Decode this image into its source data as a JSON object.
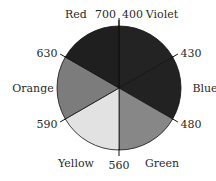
{
  "chart_data": {
    "type": "pie",
    "title": "",
    "slices": [
      {
        "name": "Violet",
        "value": 1,
        "start_wavelength": "400",
        "end_wavelength": "430",
        "color": "#232323"
      },
      {
        "name": "Blue",
        "value": 1,
        "start_wavelength": "430",
        "end_wavelength": "480",
        "color": "#222222"
      },
      {
        "name": "Green",
        "value": 1,
        "start_wavelength": "480",
        "end_wavelength": "560",
        "color": "#878787"
      },
      {
        "name": "Yellow",
        "value": 1,
        "start_wavelength": "560",
        "end_wavelength": "590",
        "color": "#e2e2e2"
      },
      {
        "name": "Orange",
        "value": 1,
        "start_wavelength": "590",
        "end_wavelength": "630",
        "color": "#7c7c7c"
      },
      {
        "name": "Red",
        "value": 1,
        "start_wavelength": "630",
        "end_wavelength": "700",
        "color": "#1f1f1f"
      }
    ],
    "boundary_labels": [
      "400",
      "430",
      "480",
      "560",
      "590",
      "630",
      "700"
    ],
    "legend": "none"
  }
}
